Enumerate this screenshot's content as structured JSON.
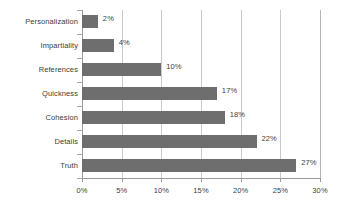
{
  "chart_data": {
    "type": "bar",
    "orientation": "horizontal",
    "title": "",
    "subtitle": "",
    "xlabel": "",
    "ylabel": "",
    "categories": [
      "Personalization",
      "Impartiality",
      "References",
      "Quickness",
      "Cohesion",
      "Details",
      "Truth"
    ],
    "values": [
      2,
      4,
      10,
      17,
      18,
      22,
      27
    ],
    "data_labels": [
      "2%",
      "4%",
      "10%",
      "17%",
      "18%",
      "22%",
      "27%"
    ],
    "xlim": [
      0,
      30
    ],
    "xtick_values": [
      0,
      5,
      10,
      15,
      20,
      25,
      30
    ],
    "xtick_labels": [
      "0%",
      "5%",
      "10%",
      "15%",
      "20%",
      "25%",
      "30%"
    ],
    "grid": "vertical",
    "legend": "none",
    "series": [
      {
        "name": "",
        "values": [
          2,
          4,
          10,
          17,
          18,
          22,
          27
        ]
      }
    ],
    "colors": {
      "bar": "#6e6e6e",
      "gridline": "#c9c9c9",
      "axis": "#9a9a9a",
      "text": "#3d3d3d",
      "background": "#ffffff"
    }
  }
}
